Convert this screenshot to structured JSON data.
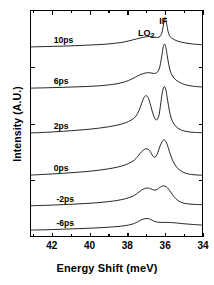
{
  "chart_data": {
    "type": "line",
    "title": "",
    "xlabel": "Energy Shift (meV)",
    "ylabel": "Intensity (A.U.)",
    "xlim": [
      43.15,
      34.0
    ],
    "x_reversed": true,
    "xticks": [
      42,
      40,
      38,
      36,
      34
    ],
    "xtick_labels": [
      "42",
      "40",
      "38",
      "36",
      "34"
    ],
    "x_minor_ticks": [
      43,
      41,
      39,
      37,
      35
    ],
    "ylim": [
      0,
      1
    ],
    "yticks_labeled": false,
    "grid": false,
    "legend": false,
    "waterfall": true,
    "annotations": [
      {
        "text": "LO",
        "sub": "2",
        "x": 36.85,
        "y_px": 28,
        "name": "lo2-peak-label"
      },
      {
        "text": "IF",
        "sub": "",
        "x": 36.05,
        "y_px": 16,
        "name": "if-peak-label"
      }
    ],
    "peak_positions_meV": {
      "LO2": 36.95,
      "IF": 36.05
    },
    "series": [
      {
        "name": "10ps",
        "label": "10ps",
        "label_x": 41.9,
        "baseline_px": 48,
        "points": [
          [
            43.15,
            46.2
          ],
          [
            42.6,
            46.0
          ],
          [
            42.0,
            45.7
          ],
          [
            41.4,
            45.4
          ],
          [
            40.8,
            45.0
          ],
          [
            40.2,
            44.5
          ],
          [
            39.6,
            44.0
          ],
          [
            39.0,
            43.2
          ],
          [
            38.5,
            42.2
          ],
          [
            38.1,
            41.0
          ],
          [
            37.8,
            39.6
          ],
          [
            37.5,
            38.2
          ],
          [
            37.25,
            37.0
          ],
          [
            37.05,
            36.2
          ],
          [
            36.9,
            35.8
          ],
          [
            36.75,
            35.8
          ],
          [
            36.6,
            36.2
          ],
          [
            36.45,
            36.6
          ],
          [
            36.3,
            36.4
          ],
          [
            36.2,
            34.5
          ],
          [
            36.12,
            30.0
          ],
          [
            36.05,
            22.5
          ],
          [
            35.98,
            16.5
          ],
          [
            35.92,
            20.0
          ],
          [
            35.85,
            27.5
          ],
          [
            35.78,
            33.0
          ],
          [
            35.7,
            36.0
          ],
          [
            35.55,
            38.2
          ],
          [
            35.35,
            40.0
          ],
          [
            35.1,
            41.4
          ],
          [
            34.8,
            42.5
          ],
          [
            34.5,
            43.3
          ],
          [
            34.2,
            43.8
          ],
          [
            34.0,
            44.0
          ]
        ]
      },
      {
        "name": "6ps",
        "label": "6ps",
        "label_x": 41.9,
        "baseline_px": 89,
        "points": [
          [
            43.15,
            87.8
          ],
          [
            42.6,
            87.6
          ],
          [
            42.0,
            87.3
          ],
          [
            41.4,
            87.0
          ],
          [
            40.8,
            86.6
          ],
          [
            40.2,
            86.2
          ],
          [
            39.6,
            85.6
          ],
          [
            39.0,
            84.6
          ],
          [
            38.5,
            83.2
          ],
          [
            38.1,
            81.3
          ],
          [
            37.8,
            79.0
          ],
          [
            37.55,
            76.6
          ],
          [
            37.35,
            74.6
          ],
          [
            37.15,
            73.2
          ],
          [
            36.98,
            72.4
          ],
          [
            36.85,
            72.2
          ],
          [
            36.7,
            72.6
          ],
          [
            36.55,
            73.0
          ],
          [
            36.42,
            72.2
          ],
          [
            36.3,
            69.0
          ],
          [
            36.22,
            63.0
          ],
          [
            36.14,
            54.0
          ],
          [
            36.07,
            46.0
          ],
          [
            36.0,
            43.5
          ],
          [
            35.93,
            47.0
          ],
          [
            35.86,
            55.0
          ],
          [
            35.78,
            64.0
          ],
          [
            35.7,
            70.5
          ],
          [
            35.58,
            75.5
          ],
          [
            35.4,
            79.5
          ],
          [
            35.15,
            82.5
          ],
          [
            34.85,
            84.6
          ],
          [
            34.5,
            85.8
          ],
          [
            34.2,
            86.4
          ],
          [
            34.0,
            86.6
          ]
        ]
      },
      {
        "name": "2ps",
        "label": "2ps",
        "label_x": 41.9,
        "baseline_px": 134,
        "points": [
          [
            43.15,
            133.0
          ],
          [
            42.6,
            132.6
          ],
          [
            42.0,
            132.0
          ],
          [
            41.4,
            131.3
          ],
          [
            40.8,
            130.5
          ],
          [
            40.2,
            129.6
          ],
          [
            39.6,
            128.4
          ],
          [
            39.0,
            126.8
          ],
          [
            38.5,
            125.0
          ],
          [
            38.1,
            122.8
          ],
          [
            37.8,
            120.2
          ],
          [
            37.6,
            117.5
          ],
          [
            37.45,
            113.5
          ],
          [
            37.3,
            107.0
          ],
          [
            37.18,
            100.5
          ],
          [
            37.08,
            96.5
          ],
          [
            36.98,
            95.5
          ],
          [
            36.88,
            97.5
          ],
          [
            36.78,
            103.0
          ],
          [
            36.68,
            110.0
          ],
          [
            36.58,
            116.0
          ],
          [
            36.48,
            119.5
          ],
          [
            36.4,
            119.5
          ],
          [
            36.3,
            115.0
          ],
          [
            36.22,
            105.0
          ],
          [
            36.14,
            94.0
          ],
          [
            36.06,
            87.5
          ],
          [
            35.99,
            86.5
          ],
          [
            35.92,
            91.0
          ],
          [
            35.84,
            100.0
          ],
          [
            35.75,
            110.0
          ],
          [
            35.65,
            118.0
          ],
          [
            35.5,
            124.0
          ],
          [
            35.3,
            128.0
          ],
          [
            35.05,
            130.5
          ],
          [
            34.75,
            131.8
          ],
          [
            34.4,
            132.5
          ],
          [
            34.0,
            132.8
          ]
        ]
      },
      {
        "name": "0ps",
        "label": "0ps",
        "label_x": 41.9,
        "baseline_px": 176,
        "points": [
          [
            43.15,
            175.5
          ],
          [
            42.6,
            175.0
          ],
          [
            42.0,
            174.4
          ],
          [
            41.4,
            173.7
          ],
          [
            40.8,
            172.9
          ],
          [
            40.2,
            172.0
          ],
          [
            39.6,
            170.8
          ],
          [
            39.0,
            169.2
          ],
          [
            38.5,
            167.4
          ],
          [
            38.1,
            165.2
          ],
          [
            37.8,
            162.6
          ],
          [
            37.6,
            160.0
          ],
          [
            37.45,
            157.0
          ],
          [
            37.3,
            153.5
          ],
          [
            37.15,
            150.5
          ],
          [
            37.0,
            149.0
          ],
          [
            36.88,
            149.5
          ],
          [
            36.76,
            152.0
          ],
          [
            36.66,
            155.5
          ],
          [
            36.56,
            157.5
          ],
          [
            36.46,
            156.5
          ],
          [
            36.36,
            152.5
          ],
          [
            36.26,
            147.0
          ],
          [
            36.14,
            142.0
          ],
          [
            36.04,
            140.0
          ],
          [
            35.94,
            141.5
          ],
          [
            35.84,
            146.0
          ],
          [
            35.74,
            152.0
          ],
          [
            35.62,
            158.5
          ],
          [
            35.45,
            165.0
          ],
          [
            35.2,
            170.5
          ],
          [
            34.9,
            173.5
          ],
          [
            34.55,
            175.0
          ],
          [
            34.2,
            175.5
          ],
          [
            34.0,
            175.7
          ]
        ]
      },
      {
        "name": "-2ps",
        "label": "-2ps",
        "label_x": 41.75,
        "baseline_px": 207,
        "points": [
          [
            43.15,
            206.5
          ],
          [
            42.6,
            206.2
          ],
          [
            42.0,
            205.8
          ],
          [
            41.4,
            205.3
          ],
          [
            40.8,
            204.8
          ],
          [
            40.2,
            204.2
          ],
          [
            39.6,
            203.4
          ],
          [
            39.0,
            202.3
          ],
          [
            38.5,
            201.0
          ],
          [
            38.1,
            199.4
          ],
          [
            37.8,
            197.6
          ],
          [
            37.6,
            195.8
          ],
          [
            37.45,
            193.8
          ],
          [
            37.3,
            191.6
          ],
          [
            37.15,
            189.8
          ],
          [
            37.0,
            188.8
          ],
          [
            36.88,
            188.6
          ],
          [
            36.76,
            189.2
          ],
          [
            36.64,
            190.2
          ],
          [
            36.52,
            190.8
          ],
          [
            36.4,
            190.0
          ],
          [
            36.28,
            188.4
          ],
          [
            36.16,
            187.0
          ],
          [
            36.04,
            186.4
          ],
          [
            35.92,
            187.2
          ],
          [
            35.8,
            189.4
          ],
          [
            35.68,
            192.6
          ],
          [
            35.55,
            196.0
          ],
          [
            35.4,
            199.4
          ],
          [
            35.2,
            202.2
          ],
          [
            34.95,
            204.0
          ],
          [
            34.65,
            204.8
          ],
          [
            34.3,
            205.2
          ],
          [
            34.0,
            205.4
          ]
        ]
      },
      {
        "name": "-6ps",
        "label": "-6ps",
        "label_x": 41.75,
        "baseline_px": 231,
        "points": [
          [
            43.15,
            231.0
          ],
          [
            42.6,
            230.8
          ],
          [
            42.0,
            230.5
          ],
          [
            41.4,
            230.1
          ],
          [
            40.8,
            229.7
          ],
          [
            40.2,
            229.3
          ],
          [
            39.6,
            228.8
          ],
          [
            39.0,
            228.1
          ],
          [
            38.5,
            227.4
          ],
          [
            38.1,
            226.5
          ],
          [
            37.8,
            225.4
          ],
          [
            37.6,
            224.2
          ],
          [
            37.45,
            222.8
          ],
          [
            37.3,
            221.2
          ],
          [
            37.15,
            220.0
          ],
          [
            37.0,
            219.4
          ],
          [
            36.88,
            219.4
          ],
          [
            36.76,
            220.2
          ],
          [
            36.64,
            221.4
          ],
          [
            36.52,
            222.4
          ],
          [
            36.4,
            223.0
          ],
          [
            36.2,
            223.3
          ],
          [
            36.0,
            223.3
          ],
          [
            35.8,
            223.3
          ],
          [
            35.6,
            223.5
          ],
          [
            35.3,
            224.0
          ],
          [
            35.0,
            224.6
          ],
          [
            34.6,
            225.2
          ],
          [
            34.2,
            225.7
          ],
          [
            34.0,
            226.0
          ]
        ]
      }
    ]
  },
  "axis": {
    "x_tick_labels": [
      "42",
      "40",
      "38",
      "36",
      "34"
    ],
    "x_title": "Energy Shift (meV)",
    "y_title": "Intensity  (A.U.)"
  },
  "peaks": {
    "lo2_text": "LO",
    "lo2_sub": "2",
    "if_text": "IF"
  },
  "traces": {
    "t10": "10ps",
    "t6": "6ps",
    "t2": "2ps",
    "t0": "0ps",
    "tm2": "-2ps",
    "tm6": "-6ps"
  }
}
